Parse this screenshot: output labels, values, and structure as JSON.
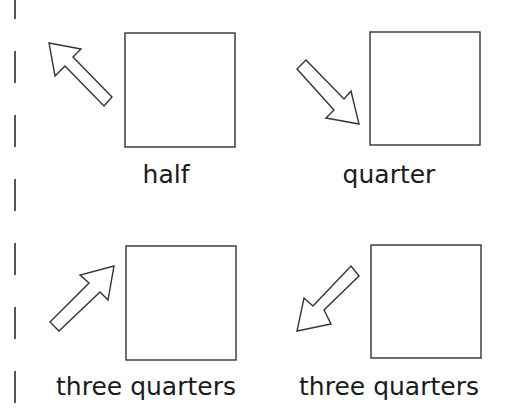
{
  "diagram": {
    "panels": [
      {
        "label": "half",
        "arrow_direction": "up-left"
      },
      {
        "label": "quarter",
        "arrow_direction": "down-right"
      },
      {
        "label": "three quarters",
        "arrow_direction": "up-right"
      },
      {
        "label": "three quarters",
        "arrow_direction": "down-left"
      }
    ],
    "colors": {
      "stroke": "#333333",
      "background": "#ffffff",
      "text": "#1a1a1a"
    }
  }
}
